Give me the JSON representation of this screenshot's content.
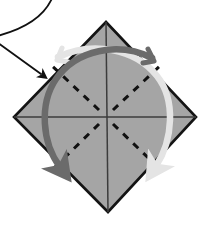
{
  "figure": {
    "caption": "",
    "colors": {
      "paper_fill": "#a5a5a5",
      "paper_outline": "#141414",
      "crease_solid": "#3c3c3c",
      "crease_dashed": "#111111",
      "arrow_dark": "#6b6b6b",
      "arrow_light": "#e4e4e4",
      "pointer_arrow": "#111111",
      "background": "#ffffff"
    },
    "shape": {
      "name": "diamond",
      "vertices": [
        {
          "label": "top",
          "x": 106,
          "y": 22
        },
        {
          "label": "right",
          "x": 196,
          "y": 117
        },
        {
          "label": "bottom",
          "x": 108,
          "y": 212
        },
        {
          "label": "left",
          "x": 14,
          "y": 117
        }
      ],
      "center": {
        "x": 106,
        "y": 117
      }
    },
    "creases": {
      "solid_count": 2,
      "solid_labels": [
        "vertical-midline",
        "horizontal-midline"
      ],
      "dashed_count": 4,
      "dashed_labels": [
        "diagonal-to-top-left",
        "diagonal-to-top-right",
        "diagonal-to-bottom-right",
        "diagonal-to-bottom-left"
      ],
      "dash_pattern": "7 7"
    },
    "arrows": [
      {
        "name": "rotate-arrow-dark",
        "color": "#6b6b6b",
        "direction": "counter-clockwise",
        "start": {
          "x": 154,
          "y": 55
        },
        "end": {
          "x": 62,
          "y": 172
        }
      },
      {
        "name": "rotate-arrow-light",
        "color": "#e4e4e4",
        "direction": "clockwise",
        "start": {
          "x": 58,
          "y": 57
        },
        "end": {
          "x": 156,
          "y": 170
        }
      },
      {
        "name": "pointer-arrow",
        "color": "#111111",
        "direction": "down-right",
        "start": {
          "x": 0,
          "y": 44
        },
        "end": {
          "x": 44,
          "y": 76
        }
      },
      {
        "name": "lead-curve",
        "color": "#111111",
        "direction": "curve",
        "start": {
          "x": 52,
          "y": 0
        },
        "end": {
          "x": 0,
          "y": 34
        }
      }
    ]
  }
}
